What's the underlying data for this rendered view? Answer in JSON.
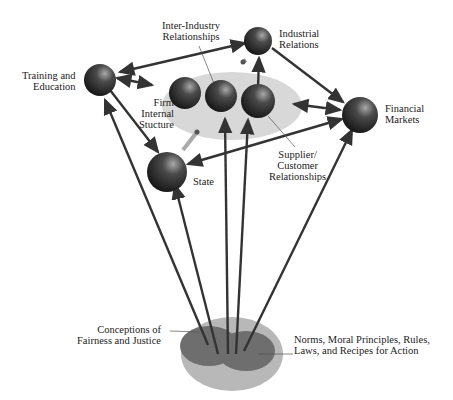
{
  "diagram": {
    "nodes": {
      "training": "Training and\nEducation",
      "inter_industry": "Inter-Industry\nRelationships",
      "industrial": "Industrial\nRelations",
      "firm": "Firm\nInternal\nStucture",
      "financial": "Financial\nMarkets",
      "supplier": "Supplier/\nCustomer\nRelationships",
      "state": "State",
      "fairness": "Conceptions of\nFairness and Justice",
      "norms": "Norms, Moral Principles, Rules,\nLaws, and Recipes for Action"
    },
    "colors": {
      "sphere": "#2a2a2a",
      "ellipse": "#d8d8d8",
      "base_outer": "#b8b8b8",
      "base_inner": "#6e6e6e",
      "arrow": "#3a3a3a"
    }
  }
}
